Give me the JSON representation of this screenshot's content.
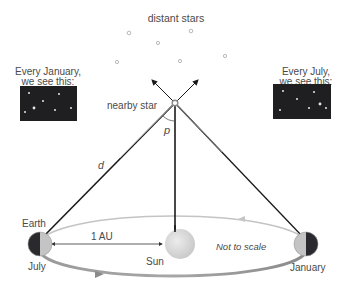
{
  "labels": {
    "distant_stars": "distant stars",
    "january_caption_line1": "Every January,",
    "january_caption_line2": "we see this:",
    "july_caption_line1": "Every July,",
    "july_caption_line2": "we see this:",
    "nearby_star": "nearby star",
    "parallax_angle": "p",
    "distance": "d",
    "earth": "Earth",
    "au": "1 AU",
    "sun": "Sun",
    "not_to_scale": "Not to scale",
    "july": "July",
    "january": "January"
  },
  "colors": {
    "background": "#ffffff",
    "text": "#4a4a4a",
    "sky_panel": "#1f1f22",
    "line_dark": "#1a1a1a",
    "line_gray": "#9a9a9a",
    "orbit_back": "#bcbcbc",
    "orbit_front": "#8e8e8e",
    "sun": "#dcdcdc",
    "star_ring": "#b8b8b8"
  }
}
